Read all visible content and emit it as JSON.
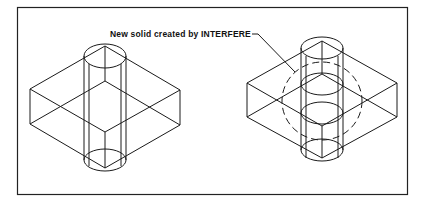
{
  "figure": {
    "annotation": {
      "text": "New solid created by INTERFERE"
    },
    "left_drawing": {
      "description": "Box and cylinder before INTERFERE"
    },
    "right_drawing": {
      "description": "Box and cylinder with interference solid"
    },
    "colors": {
      "line": "#1a1a1a",
      "background": "#ffffff"
    }
  }
}
